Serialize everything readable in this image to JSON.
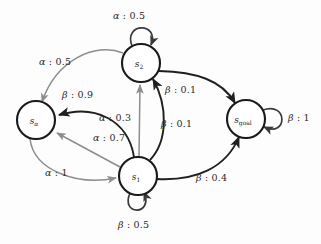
{
  "diagram": {
    "background_color": "#fdfdfd",
    "stroke_dark": "#1f1f1f",
    "stroke_gray": "#8d8d8d",
    "nodes": [
      {
        "id": "s2",
        "base": "s",
        "sub": "2",
        "cx": 141,
        "cy": 63,
        "r": 19
      },
      {
        "id": "sa",
        "base": "s",
        "sub": "α",
        "cx": 36,
        "cy": 120,
        "r": 19
      },
      {
        "id": "sgoal",
        "base": "s",
        "sub": "goal",
        "cx": 246,
        "cy": 119,
        "r": 19
      },
      {
        "id": "s1",
        "base": "s",
        "sub": "1",
        "cx": 138,
        "cy": 176,
        "r": 19
      }
    ],
    "edges": [
      {
        "id": "s2-self",
        "from": "s2",
        "to": "s2",
        "action": "α",
        "prob": "0.5",
        "label": "α : 0.5",
        "color": "dark",
        "kind": "self-loop-top"
      },
      {
        "id": "s2-sa",
        "from": "s2",
        "to": "sa",
        "action": "α",
        "prob": "0.5",
        "label": "α : 0.5",
        "color": "gray",
        "kind": "curve"
      },
      {
        "id": "s1-sa-beta",
        "from": "s1",
        "to": "sa",
        "action": "β",
        "prob": "0.9",
        "label": "β : 0.9",
        "color": "dark",
        "kind": "curve"
      },
      {
        "id": "s1-s2-alpha",
        "from": "s1",
        "to": "s2",
        "action": "α",
        "prob": "0.3",
        "label": "α : 0.3",
        "color": "gray",
        "kind": "straight"
      },
      {
        "id": "s1-sa-alpha",
        "from": "s1",
        "to": "sa",
        "action": "α",
        "prob": "0.7",
        "label": "α : 0.7",
        "color": "gray",
        "kind": "straight"
      },
      {
        "id": "sa-s1-alpha",
        "from": "sa",
        "to": "s1",
        "action": "α",
        "prob": "1",
        "label": "α : 1",
        "color": "gray",
        "kind": "curve"
      },
      {
        "id": "s2-sgoal",
        "from": "s2",
        "to": "sgoal",
        "action": "β",
        "prob": "0.1",
        "label": "β : 0.1",
        "color": "dark",
        "kind": "curve"
      },
      {
        "id": "s1-s2-beta",
        "from": "s1",
        "to": "s2",
        "action": "β",
        "prob": "0.1",
        "label": "β : 0.1",
        "color": "dark",
        "kind": "curve"
      },
      {
        "id": "s1-sgoal",
        "from": "s1",
        "to": "sgoal",
        "action": "β",
        "prob": "0.4",
        "label": "β : 0.4",
        "color": "dark",
        "kind": "curve"
      },
      {
        "id": "sgoal-self",
        "from": "sgoal",
        "to": "sgoal",
        "action": "β",
        "prob": "1",
        "label": "β : 1",
        "color": "dark",
        "kind": "self-loop-right"
      },
      {
        "id": "s1-self",
        "from": "s1",
        "to": "s1",
        "action": "β",
        "prob": "0.5",
        "label": "β : 0.5",
        "color": "dark",
        "kind": "self-loop-bottom"
      }
    ],
    "labels": {
      "s2_self": {
        "greek": "α",
        "rest": " : 0.5",
        "x": 113,
        "y": 10
      },
      "s2_sa": {
        "greek": "α",
        "rest": " : 0.5",
        "x": 39,
        "y": 56
      },
      "s1_sa_beta": {
        "greek": "β",
        "rest": " : 0.9",
        "x": 62,
        "y": 89
      },
      "s1_s2_alpha": {
        "greek": "α",
        "rest": " : 0.3",
        "x": 99,
        "y": 112
      },
      "s1_sa_alpha": {
        "greek": "α",
        "rest": " : 0.7",
        "x": 93,
        "y": 132
      },
      "sa_s1_alpha": {
        "greek": "α",
        "rest": " : 1",
        "x": 45,
        "y": 167
      },
      "s2_sgoal": {
        "greek": "β",
        "rest": " : 0.1",
        "x": 165,
        "y": 84
      },
      "s1_s2_beta": {
        "greek": "β",
        "rest": " : 0.1",
        "x": 161,
        "y": 118
      },
      "s1_sgoal": {
        "greek": "β",
        "rest": " : 0.4",
        "x": 196,
        "y": 172
      },
      "sgoal_self": {
        "greek": "β",
        "rest": " : 1",
        "x": 288,
        "y": 112
      },
      "s1_self": {
        "greek": "β",
        "rest": " : 0.5",
        "x": 118,
        "y": 219
      }
    }
  }
}
